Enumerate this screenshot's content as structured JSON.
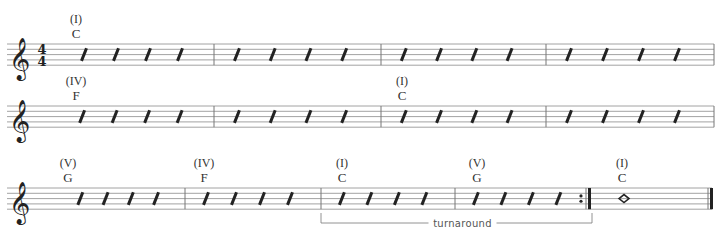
{
  "time_signature": {
    "top": "4",
    "bottom": "4"
  },
  "clef": "treble-clef",
  "systems": [
    {
      "y": 44,
      "barlines": [
        214,
        381,
        546,
        714
      ],
      "measures": [
        {
          "x0": 60,
          "x1": 214,
          "slashes": 4,
          "chord": "C",
          "roman": "(I)",
          "chord_x": 76
        },
        {
          "x0": 214,
          "x1": 381,
          "slashes": 4
        },
        {
          "x0": 381,
          "x1": 546,
          "slashes": 4
        },
        {
          "x0": 546,
          "x1": 714,
          "slashes": 4
        }
      ]
    },
    {
      "y": 106,
      "barlines": [
        214,
        381,
        546,
        714
      ],
      "measures": [
        {
          "x0": 40,
          "x1": 214,
          "slashes": 4,
          "chord": "F",
          "roman": "(IV)",
          "chord_x": 76
        },
        {
          "x0": 214,
          "x1": 381,
          "slashes": 4
        },
        {
          "x0": 381,
          "x1": 546,
          "slashes": 4,
          "chord": "C",
          "roman": "(I)",
          "chord_x": 402
        },
        {
          "x0": 546,
          "x1": 714,
          "slashes": 4
        }
      ]
    },
    {
      "y": 188,
      "barlines": [
        185,
        321,
        455,
        712
      ],
      "repeat_end_x": 589,
      "measures": [
        {
          "x0": 40,
          "x1": 185,
          "slashes": 4,
          "chord": "G",
          "roman": "(V)",
          "chord_x": 68
        },
        {
          "x0": 185,
          "x1": 321,
          "slashes": 4,
          "chord": "F",
          "roman": "(IV)",
          "chord_x": 204
        },
        {
          "x0": 321,
          "x1": 455,
          "slashes": 4,
          "chord": "C",
          "roman": "(I)",
          "chord_x": 342
        },
        {
          "x0": 455,
          "x1": 589,
          "slashes": 4,
          "chord": "G",
          "roman": "(V)",
          "chord_x": 477
        },
        {
          "x0": 592,
          "x1": 712,
          "whole_note": true,
          "chord": "C",
          "roman": "(I)",
          "chord_x": 622
        }
      ]
    }
  ],
  "bracket": {
    "label": "turnaround",
    "x0": 321,
    "x1": 592,
    "y": 223
  }
}
